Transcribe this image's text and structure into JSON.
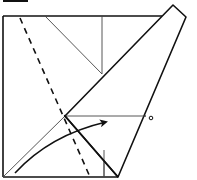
{
  "diagram": {
    "type": "origami-fold-step",
    "colors": {
      "line": "#111111",
      "thin_line": "#444444",
      "background": "#ffffff"
    },
    "elements": {
      "step_marker_bar": {
        "label": ""
      },
      "square_paper": {
        "label": ""
      },
      "folded_flap": {
        "label": ""
      },
      "valley_fold_dashed": {
        "label": ""
      },
      "fold_arrow": {
        "label": ""
      },
      "reference_point": {
        "label": "o"
      }
    }
  }
}
